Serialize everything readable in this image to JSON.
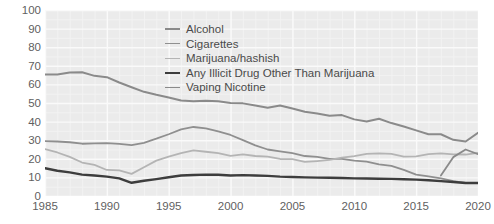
{
  "chart_data": {
    "type": "line",
    "title": "",
    "xlabel": "",
    "ylabel": "Percent",
    "xlim": [
      1985,
      2020
    ],
    "ylim": [
      0,
      100
    ],
    "ytick_step": 10,
    "xtick_step": 5,
    "ytick_labels": [
      "0",
      "10",
      "20",
      "30",
      "40",
      "50",
      "60",
      "70",
      "80",
      "90",
      "100"
    ],
    "xtick_labels": [
      "1985",
      "1990",
      "1995",
      "2000",
      "2005",
      "2010",
      "2015",
      "2020"
    ],
    "grid": true,
    "grid_minor": true,
    "legend_position": "upper-center-right",
    "series": [
      {
        "name": "Alcohol",
        "color": "#8a8a8a",
        "width": 2.0,
        "x": [
          1985,
          1986,
          1987,
          1988,
          1989,
          1990,
          1991,
          1992,
          1993,
          1994,
          1995,
          1996,
          1997,
          1998,
          1999,
          2000,
          2001,
          2002,
          2003,
          2004,
          2005,
          2006,
          2007,
          2008,
          2009,
          2010,
          2011,
          2012,
          2013,
          2014,
          2015,
          2016,
          2017,
          2018,
          2019,
          2020
        ],
        "values": [
          65.3,
          65.3,
          66.4,
          66.5,
          64.6,
          63.9,
          61.0,
          58.5,
          56.0,
          54.4,
          53.0,
          51.3,
          51.0,
          51.2,
          51.0,
          50.0,
          49.8,
          48.6,
          47.5,
          48.7,
          47.0,
          45.3,
          44.4,
          43.1,
          43.5,
          41.2,
          40.0,
          41.5,
          39.2,
          37.4,
          35.3,
          33.2,
          33.2,
          30.2,
          29.3,
          34.0
        ]
      },
      {
        "name": "Cigarettes",
        "color": "#8f8f8f",
        "width": 1.8,
        "x": [
          1985,
          1986,
          1987,
          1988,
          1989,
          1990,
          1991,
          1992,
          1993,
          1994,
          1995,
          1996,
          1997,
          1998,
          1999,
          2000,
          2001,
          2002,
          2003,
          2004,
          2005,
          2006,
          2007,
          2008,
          2009,
          2010,
          2011,
          2012,
          2013,
          2014,
          2015,
          2016,
          2017,
          2018,
          2019,
          2020
        ],
        "values": [
          29.5,
          29.3,
          28.9,
          28.1,
          28.3,
          28.4,
          28.0,
          27.3,
          28.6,
          30.8,
          33.2,
          35.8,
          37.1,
          36.3,
          34.7,
          32.8,
          30.0,
          27.2,
          25.0,
          24.0,
          23.0,
          21.5,
          21.0,
          20.0,
          20.0,
          19.0,
          18.5,
          17.0,
          16.2,
          14.0,
          11.5,
          10.5,
          9.5,
          8.0,
          7.0,
          7.0
        ]
      },
      {
        "name": "Marijuana/hashish",
        "color": "#b4b4b4",
        "width": 1.8,
        "x": [
          1985,
          1986,
          1987,
          1988,
          1989,
          1990,
          1991,
          1992,
          1993,
          1994,
          1995,
          1996,
          1997,
          1998,
          1999,
          2000,
          2001,
          2002,
          2003,
          2004,
          2005,
          2006,
          2007,
          2008,
          2009,
          2010,
          2011,
          2012,
          2013,
          2014,
          2015,
          2016,
          2017,
          2018,
          2019,
          2020
        ],
        "values": [
          25.2,
          23.4,
          21.0,
          18.0,
          16.7,
          14.0,
          13.8,
          11.9,
          15.5,
          19.0,
          21.2,
          23.0,
          24.5,
          23.8,
          23.1,
          21.6,
          22.4,
          21.5,
          21.2,
          19.9,
          19.8,
          18.3,
          18.8,
          19.4,
          20.6,
          21.4,
          22.6,
          22.9,
          22.7,
          21.2,
          21.3,
          22.5,
          22.9,
          22.4,
          22.3,
          23.2
        ]
      },
      {
        "name": "Any Illicit Drug Other Than Marijuana",
        "color": "#3d3d3d",
        "width": 2.4,
        "x": [
          1985,
          1986,
          1987,
          1988,
          1989,
          1990,
          1991,
          1992,
          1993,
          1994,
          1995,
          1996,
          1997,
          1998,
          1999,
          2000,
          2001,
          2002,
          2003,
          2004,
          2005,
          2006,
          2007,
          2008,
          2009,
          2010,
          2011,
          2012,
          2013,
          2014,
          2015,
          2016,
          2017,
          2018,
          2019,
          2020
        ],
        "values": [
          14.9,
          13.6,
          12.7,
          11.5,
          11.0,
          10.4,
          9.5,
          7.1,
          8.2,
          9.1,
          10.1,
          11.0,
          11.3,
          11.5,
          11.4,
          11.0,
          11.2,
          11.0,
          10.8,
          10.4,
          10.2,
          10.0,
          9.9,
          9.8,
          9.7,
          9.5,
          9.4,
          9.3,
          9.2,
          9.0,
          8.8,
          8.5,
          8.0,
          7.5,
          7.0,
          7.0
        ]
      },
      {
        "name": "Vaping Nicotine",
        "color": "#8a8a8a",
        "width": 1.8,
        "x": [
          2017,
          2018,
          2019,
          2020
        ],
        "values": [
          11.0,
          20.9,
          25.0,
          22.5
        ]
      }
    ]
  },
  "legend": {
    "entries": [
      {
        "label": "Alcohol"
      },
      {
        "label": "Cigarettes"
      },
      {
        "label": "Marijuana/hashish"
      },
      {
        "label": "Any Illicit Drug Other Than Marijuana"
      },
      {
        "label": "Vaping Nicotine"
      }
    ]
  },
  "colors": {
    "plot_background": "#ebebeb",
    "grid_major": "#fafafa",
    "grid_minor": "#f2f2f2",
    "tick_text": "#5f5f5f",
    "axis_label": "#6b6b6b"
  }
}
